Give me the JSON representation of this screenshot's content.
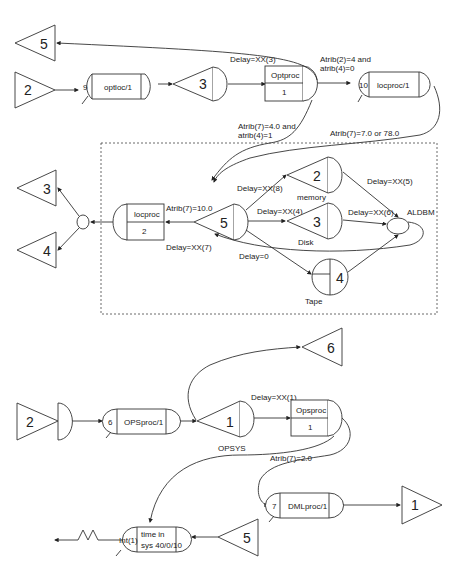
{
  "diagram": {
    "top": {
      "source_2": "2",
      "sink_5": "5",
      "optloc": {
        "count": "9",
        "label": "optloc/1"
      },
      "queue_3": "3",
      "optproc": {
        "title": "Optproc",
        "servers": "1"
      },
      "locproc1": {
        "count": "10",
        "label": "locproc/1"
      },
      "labels": {
        "delay_xx3": "Delay=XX(3)",
        "atrib2_line1": "Atrib(2)=4 and",
        "atrib2_line2": "atrib(4)=0",
        "atrib7_4_line1": "Atrib(7)=4.0 and",
        "atrib7_4_line2": "atrib(4)=1",
        "atrib7_7": "Atrib(7)=7.0 or 78.0"
      }
    },
    "middle": {
      "sink_3": "3",
      "sink_4": "4",
      "locproc": {
        "title": "locproc",
        "servers": "2"
      },
      "queue_5": "5",
      "memory": {
        "num": "2",
        "label": "memory"
      },
      "disk": {
        "num": "3",
        "label": "Disk"
      },
      "tape": {
        "num": "4",
        "label": "Tape"
      },
      "aldbm": "ALDBM",
      "labels": {
        "atrib7_10": "Atrib(7)=10.0",
        "delay_xx7": "Delay=XX(7)",
        "delay_xx8": "Delay=XX(8)",
        "delay_xx4": "Delay=XX(4)",
        "delay_xx5": "Delay=XX(5)",
        "delay_xx6": "Delay=XX(6)",
        "delay_0": "Delay=0"
      }
    },
    "bottom": {
      "sink_6": "6",
      "source_2": "2",
      "opsproc1": {
        "count": "6",
        "label": "OPSproc/1"
      },
      "queue_1": {
        "num": "1",
        "label": "OPSYS"
      },
      "opsproc": {
        "title": "Opsproc",
        "servers": "1"
      },
      "dmlproc": {
        "count": "7",
        "label": "DMLproc/1"
      },
      "sink_1": "1",
      "int_node": {
        "count": "Int(1)",
        "line1": "time in",
        "line2": "sys 40/0/10"
      },
      "source_5": "5",
      "labels": {
        "delay_xx1": "Delay=XX(1)",
        "atrib7_2": "Atrib(7)=2.0"
      }
    }
  }
}
